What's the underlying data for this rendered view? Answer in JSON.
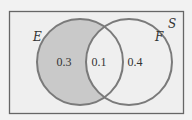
{
  "diagram": {
    "type": "venn",
    "universe": {
      "label": "S",
      "fill": "#eeeeee",
      "stroke": "#666666"
    },
    "sets": [
      {
        "label": "E",
        "shaded": true,
        "fill": "#c9c9c9",
        "stroke": "#777777"
      },
      {
        "label": "F",
        "shaded": false,
        "fill": "none",
        "stroke": "#777777"
      }
    ],
    "regions": {
      "e_only": "0.3",
      "e_and_f": "0.1",
      "f_only": "0.4"
    }
  }
}
